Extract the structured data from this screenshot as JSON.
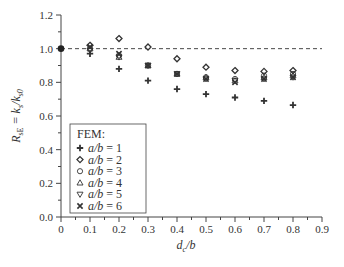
{
  "chart_data": {
    "type": "scatter",
    "title": "",
    "xlabel": "d_c/b",
    "ylabel": "R_sE = k_s/k_s0",
    "xlim": [
      0,
      0.9
    ],
    "ylim": [
      0.0,
      1.2
    ],
    "xticks": [
      "0",
      "0.1",
      "0.2",
      "0.3",
      "0.4",
      "0.5",
      "0.6",
      "0.7",
      "0.8",
      "0.9"
    ],
    "yticks": [
      "0.0",
      "0.2",
      "0.4",
      "0.6",
      "0.8",
      "1.0",
      "1.2"
    ],
    "grid": false,
    "reference_line": {
      "y": 1.0,
      "style": "dashed"
    },
    "legend": {
      "title": "FEM:",
      "position": "lower left"
    },
    "x": [
      0,
      0.1,
      0.2,
      0.3,
      0.4,
      0.5,
      0.6,
      0.7,
      0.8
    ],
    "series": [
      {
        "name": "a/b = 1",
        "marker": "plus-filled",
        "values": [
          1.0,
          0.97,
          0.88,
          0.81,
          0.76,
          0.73,
          0.71,
          0.69,
          0.665
        ]
      },
      {
        "name": "a/b = 2",
        "marker": "diamond",
        "values": [
          1.0,
          1.02,
          1.06,
          1.01,
          0.94,
          0.89,
          0.87,
          0.865,
          0.87
        ]
      },
      {
        "name": "a/b = 3",
        "marker": "circle",
        "values": [
          1.0,
          1.0,
          0.96,
          0.9,
          0.85,
          0.83,
          0.82,
          0.84,
          0.85
        ]
      },
      {
        "name": "a/b = 4",
        "marker": "triangle-up",
        "values": [
          1.0,
          1.0,
          0.95,
          0.9,
          0.85,
          0.83,
          0.81,
          0.83,
          0.84
        ]
      },
      {
        "name": "a/b = 5",
        "marker": "triangle-down",
        "values": [
          1.0,
          0.99,
          0.95,
          0.9,
          0.85,
          0.82,
          0.81,
          0.82,
          0.83
        ]
      },
      {
        "name": "a/b = 6",
        "marker": "x-cross",
        "values": [
          1.0,
          1.01,
          0.97,
          0.9,
          0.85,
          0.82,
          0.8,
          0.82,
          0.83
        ]
      }
    ]
  },
  "labels": {
    "x_axis_main": "d",
    "x_axis_sub": "c",
    "x_axis_tail": "/b",
    "y_axis_R": "R",
    "y_axis_sub": "sE",
    "y_axis_eq": " = k",
    "y_axis_sub2": "s",
    "y_axis_slash": "/k",
    "y_axis_sub3": "s0",
    "legend_title": "FEM:"
  }
}
